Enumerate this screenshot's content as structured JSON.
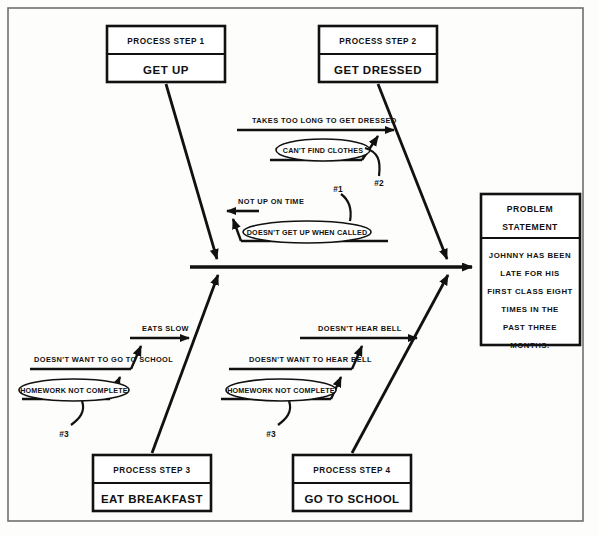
{
  "diagram": {
    "type": "fishbone-cause-and-effect",
    "title_visible": false
  },
  "problem_statement": {
    "header_line1": "PROBLEM",
    "header_line2": "STATEMENT",
    "body_lines": [
      "JOHNNY HAS BEEN",
      "LATE FOR HIS",
      "FIRST CLASS EIGHT",
      "TIMES IN THE",
      "PAST THREE",
      "MONTHS."
    ]
  },
  "process_steps": [
    {
      "header": "PROCESS STEP 1",
      "label": "GET UP"
    },
    {
      "header": "PROCESS STEP 2",
      "label": "GET DRESSED"
    },
    {
      "header": "PROCESS STEP 3",
      "label": "EAT BREAKFAST"
    },
    {
      "header": "PROCESS STEP 4",
      "label": "GO TO SCHOOL"
    }
  ],
  "causes": {
    "step1": {
      "primary": "NOT UP ON TIME",
      "root_cause": "DOESN'T GET UP WHEN CALLED",
      "reference": "#1"
    },
    "step2": {
      "primary": "TAKES TOO LONG TO GET DRESSED",
      "root_cause": "CAN'T FIND CLOTHES",
      "reference": "#2"
    },
    "step3": {
      "primary": "EATS SLOW",
      "secondary": "DOESN'T WANT TO GO TO SCHOOL",
      "root_cause": "HOMEWORK NOT COMPLETE",
      "reference": "#3"
    },
    "step4": {
      "primary": "DOESN'T HEAR BELL",
      "secondary": "DOESN'T WANT TO HEAR BELL",
      "root_cause": "HOMEWORK NOT COMPLETE",
      "reference": "#3"
    }
  },
  "colors": {
    "ink": "#111111",
    "paper": "#fdfdfc",
    "frame": "#6f6f6f"
  }
}
